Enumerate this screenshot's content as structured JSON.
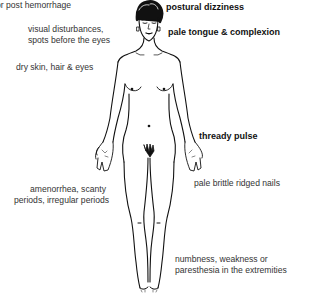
{
  "diagram": {
    "labels": [
      {
        "id": "post-hemorrhage",
        "text": "or post hemorrhage",
        "bold": false
      },
      {
        "id": "postural-dizziness",
        "text": "postural dizziness",
        "bold": true
      },
      {
        "id": "visual-disturbances-1",
        "text": "visual disturbances,",
        "bold": false
      },
      {
        "id": "visual-disturbances-2",
        "text": "spots before the eyes",
        "bold": false
      },
      {
        "id": "pale-tongue",
        "text": "pale tongue & complexion",
        "bold": true
      },
      {
        "id": "dry-skin",
        "text": "dry skin, hair & eyes",
        "bold": false
      },
      {
        "id": "thready-pulse",
        "text": "thready pulse",
        "bold": true
      },
      {
        "id": "pale-nails",
        "text": "pale brittle ridged nails",
        "bold": false
      },
      {
        "id": "amenorrhea-1",
        "text": "amenorrhea, scanty",
        "bold": false
      },
      {
        "id": "amenorrhea-2",
        "text": "periods, irregular periods",
        "bold": false
      },
      {
        "id": "numbness-1",
        "text": "numbness, weakness or",
        "bold": false
      },
      {
        "id": "numbness-2",
        "text": "paresthesia in the extremities",
        "bold": false
      }
    ]
  }
}
